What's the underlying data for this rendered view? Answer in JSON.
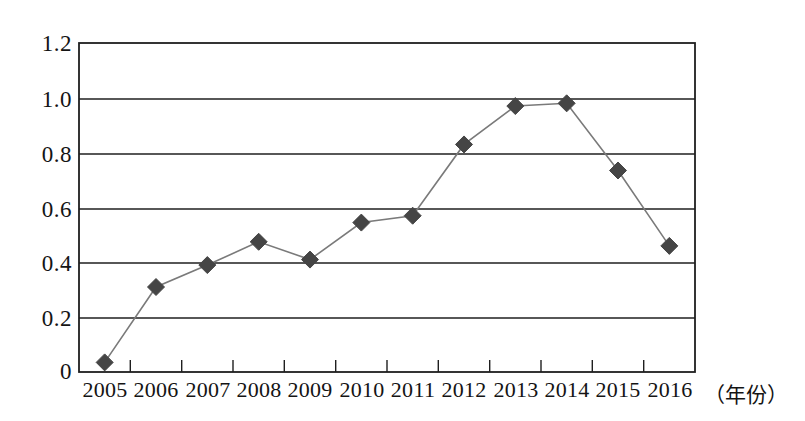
{
  "chart_data": {
    "type": "line",
    "title": "",
    "subtitle": "",
    "xlabel": "（年份）",
    "ylabel": "",
    "categories": [
      "2005",
      "2006",
      "2007",
      "2008",
      "2009",
      "2010",
      "2011",
      "2012",
      "2013",
      "2014",
      "2015",
      "2016"
    ],
    "values": [
      0.035,
      0.31,
      0.39,
      0.475,
      0.41,
      0.545,
      0.57,
      0.83,
      0.97,
      0.98,
      0.735,
      0.46
    ],
    "series": [
      {
        "name": "",
        "values": [
          0.035,
          0.31,
          0.39,
          0.475,
          0.41,
          0.545,
          0.57,
          0.83,
          0.97,
          0.98,
          0.735,
          0.46
        ]
      }
    ],
    "ylim": [
      0,
      1.2
    ],
    "yticks": [
      0,
      0.2,
      0.4,
      0.6,
      0.8,
      1.0,
      1.2
    ],
    "ytick_labels": [
      "0",
      "0.2",
      "0.4",
      "0.6",
      "0.8",
      "1.0",
      "1.2"
    ],
    "xtick_labels": [
      "2005",
      "2006",
      "2007",
      "2008",
      "2009",
      "2010",
      "2011",
      "2012",
      "2013",
      "2014",
      "2015",
      "2016"
    ],
    "grid": "horizontal",
    "legend": "none",
    "annotations": [],
    "marker": "diamond",
    "marker_color": "#454545",
    "line_color": "#7a7a7a",
    "frame_color": "#1f1f1f",
    "background": "#ffffff"
  },
  "axis": {
    "y_labels": [
      "1.2",
      "1.0",
      "0.8",
      "0.6",
      "0.4",
      "0.2",
      "0"
    ],
    "x_labels": [
      "2005",
      "2006",
      "2007",
      "2008",
      "2009",
      "2010",
      "2011",
      "2012",
      "2013",
      "2014",
      "2015",
      "2016"
    ],
    "x_title": "（年份）"
  }
}
